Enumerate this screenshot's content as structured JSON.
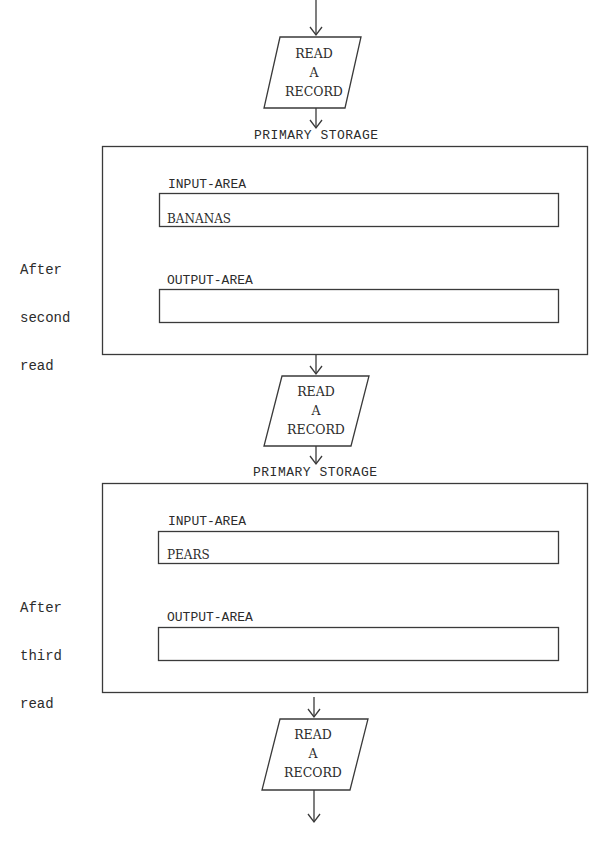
{
  "diagram": {
    "process_steps": [
      {
        "label_lines": [
          "READ",
          "A",
          "RECORD"
        ],
        "shape": "parallelogram"
      },
      {
        "label_lines": [
          "READ",
          "A",
          "RECORD"
        ],
        "shape": "parallelogram"
      },
      {
        "label_lines": [
          "READ",
          "A",
          "RECORD"
        ],
        "shape": "parallelogram"
      }
    ],
    "storage_snapshots": [
      {
        "title": "PRIMARY STORAGE",
        "side_note": [
          "After",
          "second",
          "read"
        ],
        "input_area": {
          "label": "INPUT-AREA",
          "value": "BANANAS"
        },
        "output_area": {
          "label": "OUTPUT-AREA",
          "value": ""
        }
      },
      {
        "title": "PRIMARY STORAGE",
        "side_note": [
          "After",
          "third",
          "read"
        ],
        "input_area": {
          "label": "INPUT-AREA",
          "value": "PEARS"
        },
        "output_area": {
          "label": "OUTPUT-AREA",
          "value": ""
        }
      }
    ],
    "line_color": "#3a3a3a"
  }
}
